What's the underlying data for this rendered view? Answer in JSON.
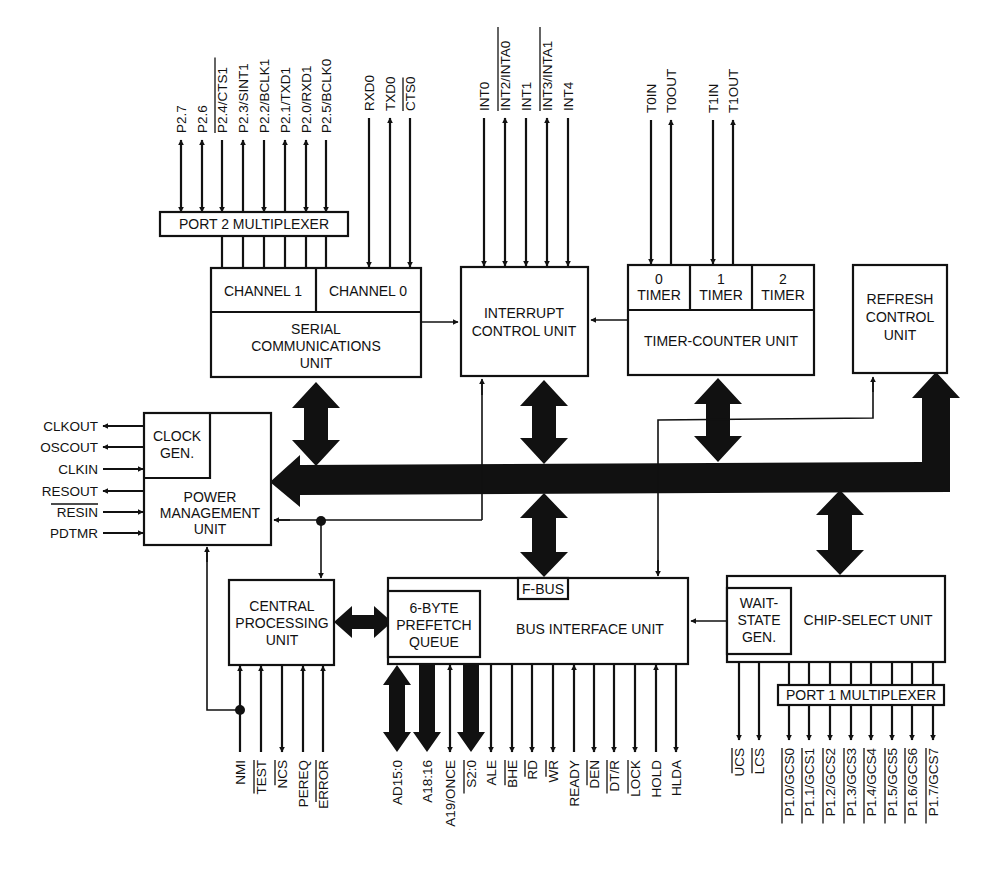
{
  "diagram": {
    "blocks": {
      "port2_mux": "PORT 2 MULTIPLEXER",
      "channel1": "CHANNEL 1",
      "channel0": "CHANNEL 0",
      "serial_unit": [
        "SERIAL",
        "COMMUNICATIONS",
        "UNIT"
      ],
      "interrupt_unit": [
        "INTERRUPT",
        "CONTROL UNIT"
      ],
      "timer0": [
        "0",
        "TIMER"
      ],
      "timer1": [
        "1",
        "TIMER"
      ],
      "timer2": [
        "2",
        "TIMER"
      ],
      "timer_counter_unit": "TIMER-COUNTER UNIT",
      "refresh_unit": [
        "REFRESH",
        "CONTROL",
        "UNIT"
      ],
      "clock_gen": [
        "CLOCK",
        "GEN."
      ],
      "power_mgmt": [
        "POWER",
        "MANAGEMENT",
        "UNIT"
      ],
      "cpu": [
        "CENTRAL",
        "PROCESSING",
        "UNIT"
      ],
      "prefetch_queue": [
        "6-BYTE",
        "PREFETCH",
        "QUEUE"
      ],
      "fbus": "F-BUS",
      "bus_interface_unit": "BUS INTERFACE UNIT",
      "wait_state_gen": [
        "WAIT-",
        "STATE",
        "GEN."
      ],
      "chip_select_unit": "CHIP-SELECT UNIT",
      "port1_mux": "PORT 1 MULTIPLEXER"
    },
    "pins": {
      "port2": [
        {
          "name": "P2.7",
          "overbar": false,
          "dir": "bi"
        },
        {
          "name": "P2.6",
          "overbar": false,
          "dir": "bi"
        },
        {
          "name": "P2.4/CTS1",
          "overbar": true,
          "dir": "in"
        },
        {
          "name": "P2.3/SINT1",
          "overbar": false,
          "dir": "out"
        },
        {
          "name": "P2.2/BCLK1",
          "overbar": false,
          "dir": "in"
        },
        {
          "name": "P2.1/TXD1",
          "overbar": false,
          "dir": "out"
        },
        {
          "name": "P2.0/RXD1",
          "overbar": false,
          "dir": "bi"
        },
        {
          "name": "P2.5/BCLK0",
          "overbar": false,
          "dir": "in"
        }
      ],
      "serial0": [
        {
          "name": "RXD0",
          "overbar": false,
          "dir": "in"
        },
        {
          "name": "TXD0",
          "overbar": false,
          "dir": "out"
        },
        {
          "name": "CTS0",
          "overbar": true,
          "dir": "in"
        }
      ],
      "interrupts": [
        {
          "name": "INT0",
          "overbar": false,
          "dir": "in"
        },
        {
          "name": "INT2/INTA0",
          "overbar": true,
          "dir": "bi"
        },
        {
          "name": "INT1",
          "overbar": false,
          "dir": "in"
        },
        {
          "name": "INT3/INTA1",
          "overbar": true,
          "dir": "bi"
        },
        {
          "name": "INT4",
          "overbar": false,
          "dir": "in"
        }
      ],
      "timers": [
        {
          "name": "T0IN",
          "overbar": false,
          "dir": "in"
        },
        {
          "name": "T0OUT",
          "overbar": false,
          "dir": "out"
        },
        {
          "name": "T1IN",
          "overbar": false,
          "dir": "in"
        },
        {
          "name": "T1OUT",
          "overbar": false,
          "dir": "out"
        }
      ],
      "clock_power": [
        {
          "name": "CLKOUT",
          "overbar": false,
          "dir": "out"
        },
        {
          "name": "OSCOUT",
          "overbar": false,
          "dir": "out"
        },
        {
          "name": "CLKIN",
          "overbar": false,
          "dir": "in"
        },
        {
          "name": "RESOUT",
          "overbar": false,
          "dir": "out"
        },
        {
          "name": "RESIN",
          "overbar": true,
          "dir": "in"
        },
        {
          "name": "PDTMR",
          "overbar": false,
          "dir": "in"
        }
      ],
      "cpu": [
        {
          "name": "NMI",
          "overbar": false,
          "dir": "in"
        },
        {
          "name": "TEST",
          "overbar": true,
          "dir": "in"
        },
        {
          "name": "NCS",
          "overbar": true,
          "dir": "out"
        },
        {
          "name": "PEREQ",
          "overbar": false,
          "dir": "in"
        },
        {
          "name": "ERROR",
          "overbar": true,
          "dir": "in"
        }
      ],
      "bus": [
        {
          "name": "AD15:0",
          "overbar": false,
          "dir": "bi-wide"
        },
        {
          "name": "A18:16",
          "overbar": false,
          "dir": "out-wide"
        },
        {
          "name": "A19/ONCE",
          "overbar": false,
          "dir": "bi"
        },
        {
          "name": "S2:0",
          "overbar": true,
          "dir": "out-wide"
        },
        {
          "name": "ALE",
          "overbar": false,
          "dir": "out"
        },
        {
          "name": "BHE",
          "overbar": true,
          "dir": "out"
        },
        {
          "name": "RD",
          "overbar": true,
          "dir": "out"
        },
        {
          "name": "WR",
          "overbar": true,
          "dir": "out"
        },
        {
          "name": "READY",
          "overbar": false,
          "dir": "in"
        },
        {
          "name": "DEN",
          "overbar": true,
          "dir": "out"
        },
        {
          "name": "DT/R",
          "overbar": true,
          "dir": "out"
        },
        {
          "name": "LOCK",
          "overbar": true,
          "dir": "out"
        },
        {
          "name": "HOLD",
          "overbar": false,
          "dir": "in"
        },
        {
          "name": "HLDA",
          "overbar": false,
          "dir": "out"
        }
      ],
      "chip_select": [
        {
          "name": "UCS",
          "overbar": true,
          "dir": "out"
        },
        {
          "name": "LCS",
          "overbar": true,
          "dir": "out"
        }
      ],
      "port1": [
        {
          "name": "P1.0/GCS0",
          "overbar": true,
          "dir": "out"
        },
        {
          "name": "P1.1/GCS1",
          "overbar": true,
          "dir": "out"
        },
        {
          "name": "P1.2/GCS2",
          "overbar": true,
          "dir": "out"
        },
        {
          "name": "P1.3/GCS3",
          "overbar": true,
          "dir": "out"
        },
        {
          "name": "P1.4/GCS4",
          "overbar": true,
          "dir": "out"
        },
        {
          "name": "P1.5/GCS5",
          "overbar": true,
          "dir": "out"
        },
        {
          "name": "P1.6/GCS6",
          "overbar": true,
          "dir": "out"
        },
        {
          "name": "P1.7/GCS7",
          "overbar": true,
          "dir": "out"
        }
      ]
    }
  }
}
